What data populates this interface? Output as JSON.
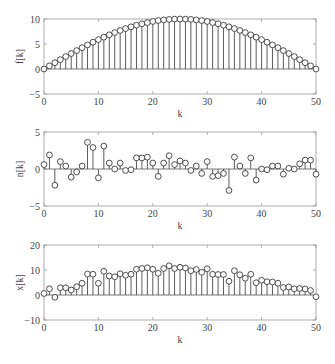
{
  "chart_data": [
    {
      "type": "stem",
      "title": "",
      "xlabel": "k",
      "ylabel": "f[k]",
      "xlim": [
        0,
        50
      ],
      "ylim": [
        -5,
        10
      ],
      "xticks": [
        0,
        10,
        20,
        30,
        40,
        50
      ],
      "yticks": [
        -5,
        0,
        5,
        10
      ],
      "grid": false,
      "x": [
        0,
        1,
        2,
        3,
        4,
        5,
        6,
        7,
        8,
        9,
        10,
        11,
        12,
        13,
        14,
        15,
        16,
        17,
        18,
        19,
        20,
        21,
        22,
        23,
        24,
        25,
        26,
        27,
        28,
        29,
        30,
        31,
        32,
        33,
        34,
        35,
        36,
        37,
        38,
        39,
        40,
        41,
        42,
        43,
        44,
        45,
        46,
        47,
        48,
        49,
        50
      ],
      "values": [
        0.0,
        0.63,
        1.25,
        1.87,
        2.49,
        3.09,
        3.68,
        4.26,
        4.82,
        5.36,
        5.88,
        6.37,
        6.84,
        7.29,
        7.71,
        8.09,
        8.44,
        8.76,
        9.05,
        9.29,
        9.51,
        9.69,
        9.82,
        9.92,
        9.98,
        10.0,
        9.98,
        9.92,
        9.82,
        9.69,
        9.51,
        9.29,
        9.05,
        8.76,
        8.44,
        8.09,
        7.71,
        7.29,
        6.84,
        6.37,
        5.88,
        5.36,
        4.82,
        4.26,
        3.68,
        3.09,
        2.49,
        1.87,
        1.25,
        0.63,
        0.0
      ]
    },
    {
      "type": "stem",
      "title": "",
      "xlabel": "k",
      "ylabel": "n[k]",
      "xlim": [
        0,
        50
      ],
      "ylim": [
        -5,
        5
      ],
      "xticks": [
        0,
        10,
        20,
        30,
        40,
        50
      ],
      "yticks": [
        -5,
        0,
        5
      ],
      "grid": false,
      "x": [
        0,
        1,
        2,
        3,
        4,
        5,
        6,
        7,
        8,
        9,
        10,
        11,
        12,
        13,
        14,
        15,
        16,
        17,
        18,
        19,
        20,
        21,
        22,
        23,
        24,
        25,
        26,
        27,
        28,
        29,
        30,
        31,
        32,
        33,
        34,
        35,
        36,
        37,
        38,
        39,
        40,
        41,
        42,
        43,
        44,
        45,
        46,
        47,
        48,
        49,
        50
      ],
      "values": [
        0.6,
        1.9,
        -2.2,
        1.0,
        0.4,
        -1.1,
        -0.4,
        0.4,
        3.6,
        2.9,
        -1.2,
        3.1,
        0.8,
        0.0,
        0.8,
        -0.2,
        -0.1,
        1.5,
        1.5,
        1.6,
        0.8,
        -1.0,
        0.8,
        1.8,
        0.6,
        1.1,
        0.8,
        -0.2,
        0.4,
        -0.6,
        1.0,
        -1.0,
        -0.9,
        -0.6,
        -2.9,
        1.6,
        0.4,
        -0.6,
        1.5,
        -1.5,
        0.0,
        -0.1,
        0.4,
        0.4,
        -0.7,
        0.1,
        0.0,
        0.7,
        1.2,
        1.2,
        -0.7
      ]
    },
    {
      "type": "stem",
      "title": "",
      "xlabel": "k",
      "ylabel": "x[k]",
      "xlim": [
        0,
        50
      ],
      "ylim": [
        -10,
        20
      ],
      "xticks": [
        0,
        10,
        20,
        30,
        40,
        50
      ],
      "yticks": [
        -10,
        0,
        10,
        20
      ],
      "grid": false,
      "x": [
        0,
        1,
        2,
        3,
        4,
        5,
        6,
        7,
        8,
        9,
        10,
        11,
        12,
        13,
        14,
        15,
        16,
        17,
        18,
        19,
        20,
        21,
        22,
        23,
        24,
        25,
        26,
        27,
        28,
        29,
        30,
        31,
        32,
        33,
        34,
        35,
        36,
        37,
        38,
        39,
        40,
        41,
        42,
        43,
        44,
        45,
        46,
        47,
        48,
        49,
        50
      ],
      "values": [
        0.6,
        2.5,
        -0.9,
        2.9,
        2.9,
        2.0,
        3.3,
        4.7,
        8.4,
        8.3,
        4.7,
        9.5,
        7.6,
        7.3,
        8.5,
        7.9,
        8.3,
        10.3,
        10.6,
        10.9,
        10.3,
        8.7,
        10.6,
        11.7,
        10.6,
        11.1,
        10.8,
        9.7,
        10.2,
        9.1,
        10.5,
        8.3,
        8.2,
        8.2,
        5.5,
        9.7,
        8.1,
        6.7,
        8.3,
        4.9,
        5.9,
        5.3,
        5.2,
        4.7,
        3.0,
        3.2,
        2.5,
        2.6,
        2.4,
        1.8,
        -0.7
      ]
    }
  ],
  "figure": {
    "panels": [
      {
        "ylabel": "f[k]",
        "xlabel": "k"
      },
      {
        "ylabel": "n[k]",
        "xlabel": "k"
      },
      {
        "ylabel": "x[k]",
        "xlabel": "k"
      }
    ]
  }
}
